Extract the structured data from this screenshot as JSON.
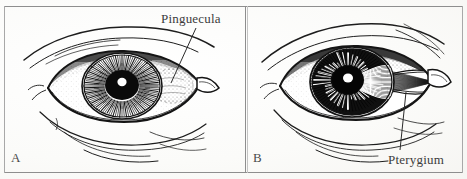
{
  "figure": {
    "type": "two-panel medical line illustration",
    "background_color": "#fdfdfb",
    "ink_color": "#1a1a1a",
    "frame_color": "#8e8e8e"
  },
  "panels": [
    {
      "id": "A",
      "letter": "A",
      "position": "left",
      "condition": "Pinguecula",
      "description": "Right eye with a raised yellowish stippled lesion on the bulbar conjunctiva at the temporal limbus, not crossing onto the cornea",
      "callout": {
        "label": "Pinguecula",
        "label_x": 161,
        "label_y": 11,
        "leader_from_x": 196,
        "leader_from_y": 28,
        "leader_to_x": 171,
        "leader_to_y": 83
      }
    },
    {
      "id": "B",
      "letter": "B",
      "position": "right",
      "condition": "Pterygium",
      "description": "Right eye with a wing-shaped fibrovascular membrane extending from the temporal conjunctiva across the limbus onto the cornea",
      "callout": {
        "label": "Pterygium",
        "label_x": 388,
        "label_y": 152,
        "leader_from_x": 400,
        "leader_from_y": 150,
        "leader_to_x": 406,
        "leader_to_y": 92
      }
    }
  ],
  "labels": {
    "panel_a_letter": "A",
    "panel_b_letter": "B",
    "pinguecula": "Pinguecula",
    "pterygium": "Pterygium"
  },
  "colors": {
    "ink": "#1a1a1a",
    "paper": "#fdfdfb",
    "frame": "#8e8e8e",
    "text": "#3b3b3b"
  }
}
